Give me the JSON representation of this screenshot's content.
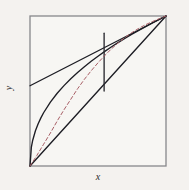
{
  "figure": {
    "caption": "",
    "xlabel": "x",
    "ylabel": "y"
  },
  "chart_data": {
    "type": "line",
    "title": "",
    "xlabel": "x",
    "ylabel": "y",
    "xlim": [
      0,
      1
    ],
    "ylim": [
      0,
      1
    ],
    "grid": false,
    "legend": "none",
    "frame_color": "#87878a",
    "background": "#f7f6f3",
    "axis_label_color": "#2a2a2a",
    "series": [
      {
        "name": "concave-curve",
        "style": "solid",
        "color": "#1d1d24",
        "width": 1.35,
        "points": [
          [
            0,
            0
          ],
          [
            0.01,
            0.126
          ],
          [
            0.02,
            0.172
          ],
          [
            0.04,
            0.235
          ],
          [
            0.06,
            0.282
          ],
          [
            0.08,
            0.321
          ],
          [
            0.1,
            0.355
          ],
          [
            0.15,
            0.426
          ],
          [
            0.2,
            0.485
          ],
          [
            0.25,
            0.536
          ],
          [
            0.3,
            0.582
          ],
          [
            0.35,
            0.623
          ],
          [
            0.4,
            0.662
          ],
          [
            0.45,
            0.698
          ],
          [
            0.5,
            0.732
          ],
          [
            0.55,
            0.764
          ],
          [
            0.6,
            0.795
          ],
          [
            0.65,
            0.824
          ],
          [
            0.7,
            0.852
          ],
          [
            0.75,
            0.879
          ],
          [
            0.8,
            0.904
          ],
          [
            0.85,
            0.929
          ],
          [
            0.9,
            0.954
          ],
          [
            0.95,
            0.977
          ],
          [
            1,
            1
          ]
        ]
      },
      {
        "name": "diagonal-line",
        "style": "solid",
        "color": "#1d1d24",
        "width": 1.35,
        "points": [
          [
            0,
            0
          ],
          [
            1,
            1
          ]
        ]
      },
      {
        "name": "tangent-line",
        "style": "solid",
        "color": "#1d1d24",
        "width": 1.35,
        "points": [
          [
            0,
            0.535
          ],
          [
            1,
            1
          ]
        ]
      },
      {
        "name": "vertical-segment",
        "style": "solid",
        "color": "#2a2a30",
        "width": 1.35,
        "points": [
          [
            0.545,
            0.5
          ],
          [
            0.545,
            0.885
          ]
        ]
      },
      {
        "name": "dashed-iterate-curve",
        "style": "dashed",
        "color": "#a85f66",
        "width": 1,
        "points": [
          [
            0,
            0
          ],
          [
            0.05,
            0.07
          ],
          [
            0.1,
            0.145
          ],
          [
            0.15,
            0.22
          ],
          [
            0.2,
            0.3
          ],
          [
            0.25,
            0.375
          ],
          [
            0.3,
            0.445
          ],
          [
            0.35,
            0.515
          ],
          [
            0.4,
            0.578
          ],
          [
            0.45,
            0.635
          ],
          [
            0.5,
            0.688
          ],
          [
            0.55,
            0.737
          ],
          [
            0.6,
            0.782
          ],
          [
            0.65,
            0.822
          ],
          [
            0.7,
            0.858
          ],
          [
            0.75,
            0.89
          ],
          [
            0.8,
            0.918
          ],
          [
            0.85,
            0.942
          ],
          [
            0.9,
            0.963
          ],
          [
            0.95,
            0.982
          ],
          [
            1,
            1
          ]
        ]
      }
    ]
  }
}
